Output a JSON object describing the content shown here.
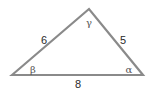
{
  "diagram": {
    "type": "triangle",
    "stroke_color": "#8a8a8a",
    "vertices": {
      "beta": {
        "x": 12,
        "y": 75
      },
      "gamma": {
        "x": 89,
        "y": 9
      },
      "alpha": {
        "x": 143,
        "y": 75
      }
    },
    "sides": {
      "left": {
        "label": "6"
      },
      "right": {
        "label": "5"
      },
      "bottom": {
        "label": "8"
      }
    },
    "angles": {
      "beta": {
        "label": "β"
      },
      "gamma": {
        "label": "γ"
      },
      "alpha": {
        "label": "α"
      }
    }
  }
}
